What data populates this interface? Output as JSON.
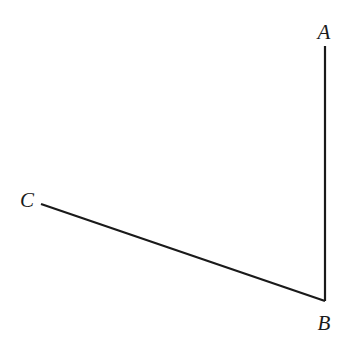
{
  "diagram": {
    "type": "angle",
    "stroke_color": "#1a1a1a",
    "points": {
      "A": {
        "label": "A",
        "x": 325,
        "y": 46,
        "label_x": 324,
        "label_y": 39
      },
      "B": {
        "label": "B",
        "x": 325,
        "y": 301,
        "label_x": 324,
        "label_y": 330
      },
      "C": {
        "label": "C",
        "x": 41,
        "y": 204,
        "label_x": 27,
        "label_y": 207
      }
    },
    "segments": [
      {
        "from": "A",
        "to": "B"
      },
      {
        "from": "B",
        "to": "C"
      }
    ],
    "labels": {
      "a": "A",
      "b": "B",
      "c": "C"
    }
  }
}
